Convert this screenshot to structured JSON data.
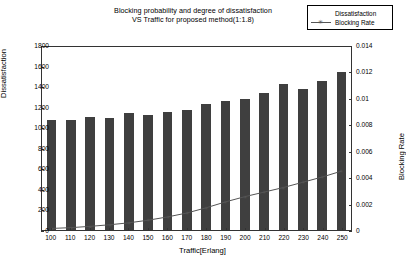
{
  "chart_data": {
    "type": "bar",
    "title": "Blocking probability and degree of dissatisfaction VS Traffic for proposed method(1:1.8)",
    "title_line1": "Blocking probability and degree of dissatisfaction",
    "title_line2": "VS Traffic for proposed method(1:1.8)",
    "xlabel": "Traffic[Erlang]",
    "ylabel": "Dissatisfaction",
    "ylabel_right": "Blocking Rate",
    "categories": [
      100,
      110,
      120,
      130,
      140,
      150,
      160,
      170,
      180,
      190,
      200,
      210,
      220,
      230,
      240,
      250
    ],
    "xtick_labels": [
      "100",
      "110",
      "120",
      "130",
      "140",
      "150",
      "160",
      "170",
      "180",
      "190",
      "200",
      "210",
      "220",
      "230",
      "240",
      "250"
    ],
    "ylim": [
      0,
      1800
    ],
    "ytick_labels": [
      "0",
      "200",
      "400",
      "600",
      "800",
      "1000",
      "1200",
      "1400",
      "1600",
      "1800"
    ],
    "ytick_values": [
      0,
      200,
      400,
      600,
      800,
      1000,
      1200,
      1400,
      1600,
      1800
    ],
    "ylim_right": [
      0,
      0.014
    ],
    "ytick_labels_right": [
      "0",
      "0.002",
      "0.004",
      "0.006",
      "0.008",
      "0.01",
      "0.012",
      "0.014"
    ],
    "ytick_values_right": [
      0,
      0.002,
      0.004,
      0.006,
      0.008,
      0.01,
      0.012,
      0.014
    ],
    "grid": false,
    "legend_position": "top-right",
    "series": [
      {
        "name": "Dissatisfaction",
        "kind": "bar",
        "axis": "left",
        "color": "#3f3f3f",
        "values": [
          1080,
          1085,
          1115,
          1100,
          1150,
          1135,
          1160,
          1180,
          1240,
          1265,
          1290,
          1345,
          1440,
          1390,
          1465,
          1550
        ]
      },
      {
        "name": "Blocking Rate",
        "kind": "line",
        "axis": "right",
        "color": "#555555",
        "marker": "star",
        "values": [
          0.00012,
          0.00018,
          0.00028,
          0.0004,
          0.00055,
          0.00075,
          0.001,
          0.0013,
          0.0017,
          0.00215,
          0.00255,
          0.0029,
          0.00325,
          0.00365,
          0.00405,
          0.0045
        ]
      }
    ]
  },
  "legend": {
    "items": [
      {
        "label": "Dissatisfaction",
        "key": "bar-swatch"
      },
      {
        "label": "Blocking Rate",
        "key": "line-marker"
      }
    ]
  }
}
